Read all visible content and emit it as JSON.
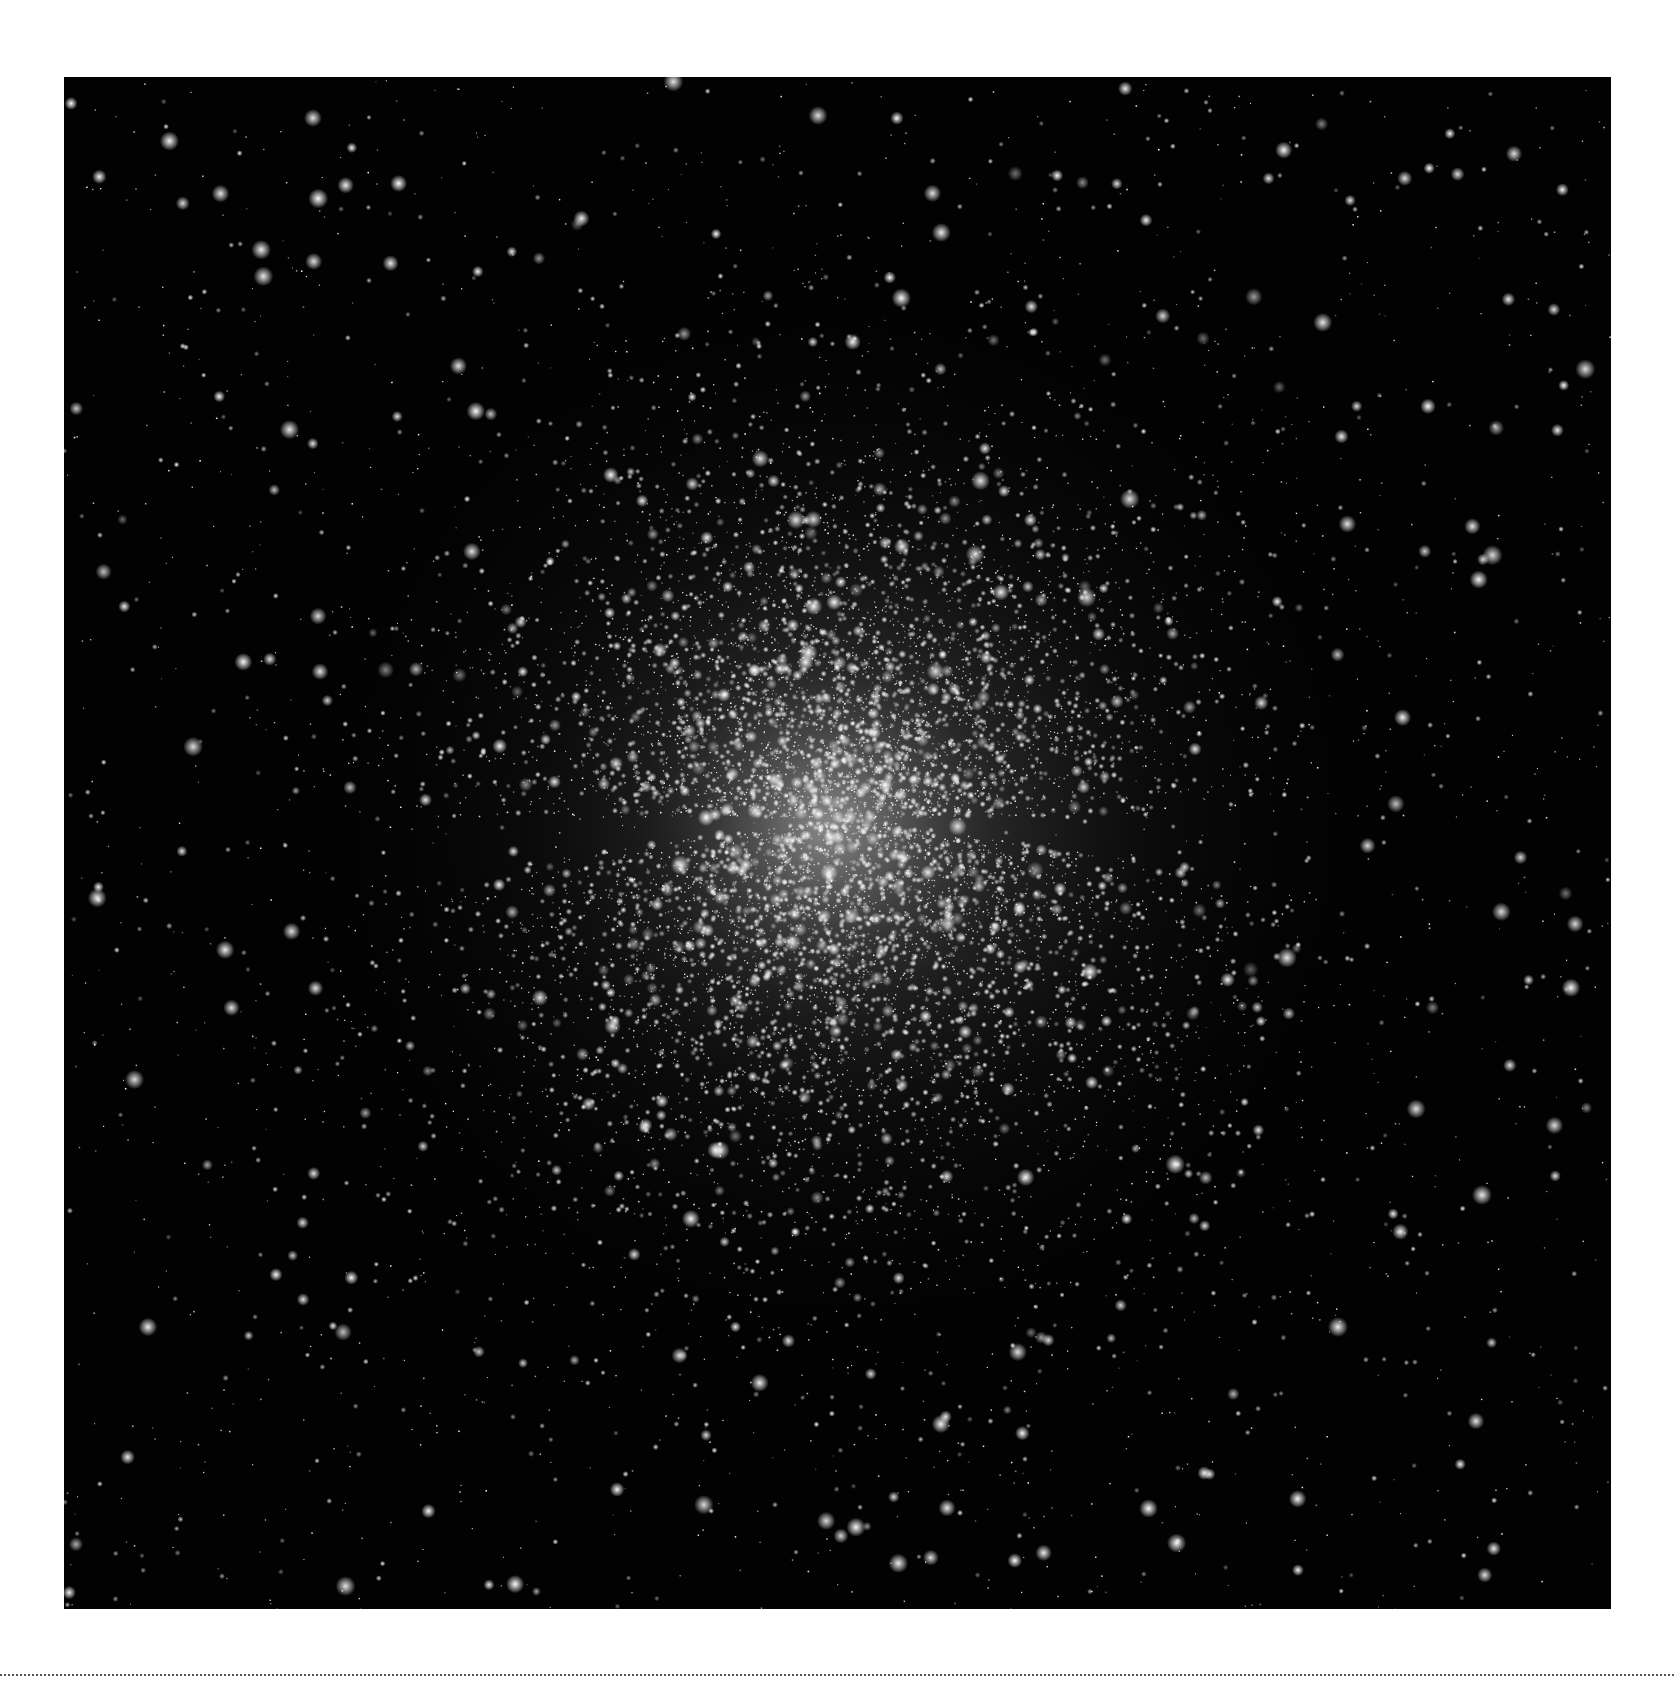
{
  "image": {
    "subject": "globular star cluster",
    "background_color": "#020202",
    "page_color": "#ffffff",
    "frame": {
      "left": 64,
      "top": 77,
      "width": 1547,
      "height": 1532
    },
    "cluster": {
      "center_x": 780,
      "center_y": 740,
      "core_radius": 210,
      "halo_radius": 560,
      "core_color": "#cfcfcf"
    },
    "starfield": {
      "seed": 42,
      "background_star_count": 1900,
      "cluster_star_count": 9000,
      "bright_star_count": 170
    }
  },
  "separator": {
    "style": "dotted",
    "color": "#555555",
    "top": 1674
  }
}
